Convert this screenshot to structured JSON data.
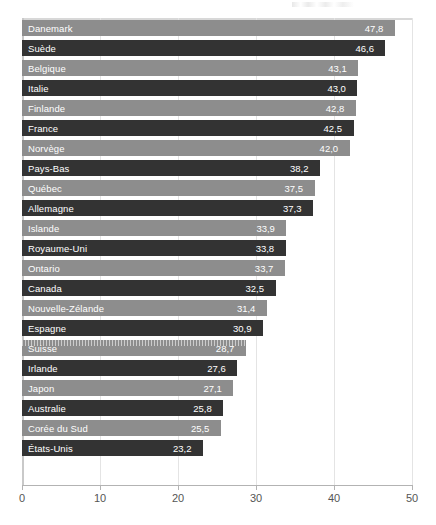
{
  "chart_data": {
    "type": "bar",
    "orientation": "horizontal",
    "title": "",
    "xlabel": "",
    "ylabel": "",
    "xlim": [
      0,
      50
    ],
    "xticks": [
      "0",
      "10",
      "20",
      "30",
      "40",
      "50"
    ],
    "grid": true,
    "legend": "none",
    "decimal_separator": ",",
    "categories": [
      "Danemark",
      "Suède",
      "Belgique",
      "Italie",
      "Finlande",
      "France",
      "Norvège",
      "Pays-Bas",
      "Québec",
      "Allemagne",
      "Islande",
      "Royaume-Uni",
      "Ontario",
      "Canada",
      "Nouvelle-Zélande",
      "Espagne",
      "Suisse",
      "Irlande",
      "Japon",
      "Australie",
      "Corée du Sud",
      "États-Unis"
    ],
    "values": [
      47.8,
      46.6,
      43.1,
      43.0,
      42.8,
      42.5,
      42.0,
      38.2,
      37.5,
      37.3,
      33.9,
      33.8,
      33.7,
      32.5,
      31.4,
      30.9,
      28.7,
      27.6,
      27.1,
      25.8,
      25.5,
      23.2
    ],
    "value_labels": [
      "47,8",
      "46,6",
      "43,1",
      "43,0",
      "42,8",
      "42,5",
      "42,0",
      "38,2",
      "37,5",
      "37,3",
      "33,9",
      "33,8",
      "33,7",
      "32,5",
      "31,4",
      "30,9",
      "28,7",
      "27,6",
      "27,1",
      "25,8",
      "25,5",
      "23,2"
    ],
    "bar_styles": [
      "light",
      "dark",
      "light",
      "dark",
      "light",
      "dark",
      "light",
      "dark",
      "light",
      "dark",
      "light",
      "dark",
      "light",
      "dark",
      "light",
      "dark",
      "light-textured",
      "dark",
      "light",
      "dark",
      "light",
      "dark"
    ]
  },
  "colors": {
    "bar_light": "#8d8d8d",
    "bar_dark": "#333333",
    "label_text": "#ffffff",
    "axis": "#b3b3b3",
    "tick_text": "#555555",
    "gridline": "#e4e4e4",
    "background": "#ffffff"
  }
}
